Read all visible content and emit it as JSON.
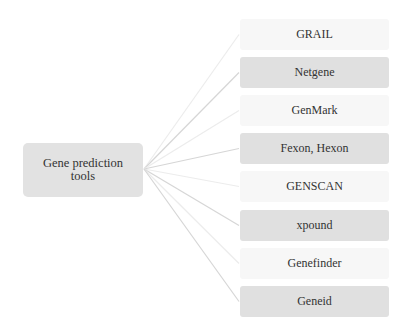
{
  "diagram": {
    "root": {
      "label": "Gene prediction tools",
      "line1": "Gene prediction",
      "line2": "tools"
    },
    "children": [
      {
        "label": "GRAIL",
        "style": "light",
        "top": 19
      },
      {
        "label": "Netgene",
        "style": "dark",
        "top": 57
      },
      {
        "label": "GenMark",
        "style": "light",
        "top": 95
      },
      {
        "label": "Fexon, Hexon",
        "style": "dark",
        "top": 133
      },
      {
        "label": "GENSCAN",
        "style": "light",
        "top": 171
      },
      {
        "label": "xpound",
        "style": "dark",
        "top": 210
      },
      {
        "label": "Genefinder",
        "style": "light",
        "top": 248
      },
      {
        "label": "Geneid",
        "style": "dark",
        "top": 286
      }
    ],
    "colors": {
      "dark_box": "#e0e0e0",
      "light_box": "#f7f7f7",
      "root_box": "#e2e2e2",
      "dark_line": "#d6d6d6",
      "light_line": "#ececec"
    }
  }
}
